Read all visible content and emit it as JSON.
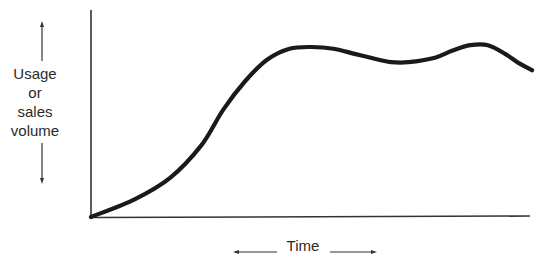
{
  "chart_data": {
    "type": "line",
    "title": "",
    "xlabel": "Time",
    "ylabel": "Usage or sales volume",
    "ylabel_lines": [
      "Usage",
      "or",
      "sales",
      "volume"
    ],
    "x_ticks": [],
    "y_ticks": [],
    "grid": false,
    "legend": null,
    "axis_ranges": {
      "x": [
        0,
        100
      ],
      "y": [
        0,
        100
      ]
    },
    "series": [
      {
        "name": "Usage or sales volume",
        "x": [
          0,
          10,
          18,
          25,
          30,
          35,
          40,
          45,
          50,
          55,
          60,
          65,
          68,
          72,
          78,
          82,
          86,
          90,
          94,
          97,
          100
        ],
        "values": [
          0,
          10,
          22,
          40,
          60,
          76,
          88,
          94,
          95,
          94,
          91,
          88,
          86.5,
          86.5,
          89,
          93,
          96,
          96,
          91,
          86,
          82
        ]
      }
    ],
    "annotations": [
      "Arrows indicate axes direction: vertical double-headed arrow beside y-label, horizontal double-headed arrow around 'Time'"
    ]
  },
  "labels": {
    "ylabel_lines": [
      "Usage",
      "or",
      "sales",
      "volume"
    ],
    "xlabel": "Time"
  },
  "colors": {
    "line": "#1a1a1a",
    "axis": "#333333",
    "background": "#ffffff"
  }
}
